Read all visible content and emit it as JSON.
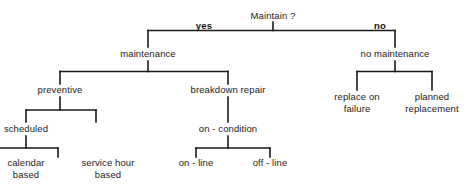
{
  "diagram": {
    "title_node": "Maintain ?",
    "background_color": "#ffffff",
    "line_color": "#1a1a1a",
    "text_color": "#1a1a1a",
    "edge_labels": {
      "yes": "yes",
      "no": "no"
    },
    "nodes": {
      "root": "Maintain ?",
      "maintenance": "maintenance",
      "no_maintenance": "no maintenance",
      "preventive": "preventive",
      "breakdown_repair": "breakdown repair",
      "replace_on_failure_line1": "replace on",
      "replace_on_failure_line2": "failure",
      "planned_replacement_line1": "planned",
      "planned_replacement_line2": "replacement",
      "scheduled": "scheduled",
      "on_condition": "on - condition",
      "calendar_based_line1": "calendar",
      "calendar_based_line2": "based",
      "service_hour_based_line1": "service hour",
      "service_hour_based_line2": "based",
      "on_line": "on - line",
      "off_line": "off - line"
    }
  }
}
